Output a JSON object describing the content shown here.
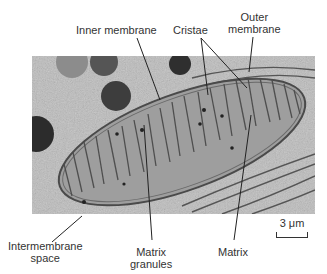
{
  "figure": {
    "labels": {
      "inner_membrane": "Inner membrane",
      "cristae": "Cristae",
      "outer_membrane": "Outer\nmembrane",
      "intermembrane_space": "Intermembrane\nspace",
      "matrix_granules": "Matrix\ngranules",
      "matrix": "Matrix"
    },
    "scale_bar": "3 μm"
  }
}
